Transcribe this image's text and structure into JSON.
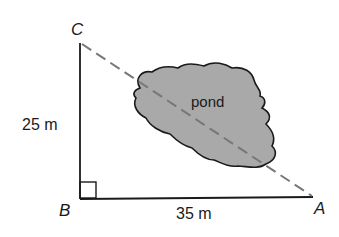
{
  "diagram": {
    "type": "right-triangle-word-problem",
    "vertices": {
      "A": "A",
      "B": "B",
      "C": "C"
    },
    "right_angle_at": "B",
    "sides": {
      "BC": {
        "label": "25 m",
        "length_m": 25
      },
      "BA": {
        "label": "35 m",
        "length_m": 35
      },
      "CA": {
        "label": "",
        "style": "dashed",
        "crosses": "pond"
      }
    },
    "region": {
      "label": "pond"
    },
    "colors": {
      "line": "#1a1a1a",
      "dashed_line": "#777777",
      "pond_fill": "#a9a9a9",
      "pond_outline": "#1a1a1a"
    }
  }
}
